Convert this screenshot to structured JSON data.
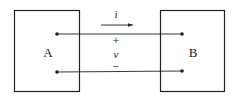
{
  "diagram": {
    "blocks": [
      {
        "id": "A",
        "label": "A"
      },
      {
        "id": "B",
        "label": "B"
      }
    ],
    "current": {
      "symbol": "i",
      "direction": "A-to-B"
    },
    "voltage": {
      "plus": "+",
      "symbol": "v",
      "minus": "−"
    },
    "colors": {
      "stroke": "#222222",
      "background": "#ffffff"
    }
  }
}
